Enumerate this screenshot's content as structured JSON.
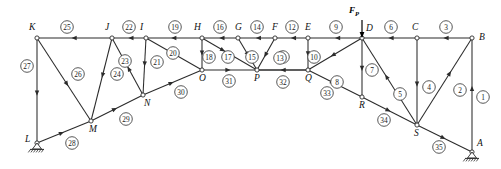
{
  "diagram": {
    "force_label": "F_P",
    "force_label_display": "F",
    "force_sub": "P",
    "force": {
      "x": 362,
      "y_label": 13,
      "y_tail": 20,
      "y_head": 37
    },
    "stroke_color": "#2b2b2b",
    "background": "#ffffff"
  },
  "nodes": [
    {
      "id": "K",
      "label": "K",
      "x": 37,
      "y": 38,
      "lx": 29,
      "ly": 30
    },
    {
      "id": "J",
      "label": "J",
      "x": 112,
      "y": 38,
      "lx": 105,
      "ly": 30
    },
    {
      "id": "I",
      "label": "I",
      "x": 146,
      "y": 38,
      "lx": 140,
      "ly": 30
    },
    {
      "id": "H",
      "label": "H",
      "x": 202,
      "y": 38,
      "lx": 194,
      "ly": 30
    },
    {
      "id": "G",
      "label": "G",
      "x": 238,
      "y": 38,
      "lx": 235,
      "ly": 30
    },
    {
      "id": "F",
      "label": "F",
      "x": 275,
      "y": 38,
      "lx": 272,
      "ly": 30
    },
    {
      "id": "E",
      "label": "E",
      "x": 308,
      "y": 38,
      "lx": 305,
      "ly": 30
    },
    {
      "id": "D",
      "label": "D",
      "x": 362,
      "y": 38,
      "lx": 366,
      "ly": 31
    },
    {
      "id": "C",
      "label": "C",
      "x": 417,
      "y": 38,
      "lx": 412,
      "ly": 30
    },
    {
      "id": "B",
      "label": "B",
      "x": 472,
      "y": 38,
      "lx": 479,
      "ly": 40
    },
    {
      "id": "L",
      "label": "L",
      "x": 37,
      "y": 143,
      "lx": 25,
      "ly": 142
    },
    {
      "id": "M",
      "label": "M",
      "x": 91,
      "y": 121,
      "lx": 89,
      "ly": 132
    },
    {
      "id": "N",
      "label": "N",
      "x": 143,
      "y": 95,
      "lx": 144,
      "ly": 106
    },
    {
      "id": "O",
      "label": "O",
      "x": 202,
      "y": 70,
      "lx": 199,
      "ly": 81
    },
    {
      "id": "P",
      "label": "P",
      "x": 257,
      "y": 70,
      "lx": 254,
      "ly": 81
    },
    {
      "id": "Q",
      "label": "Q",
      "x": 308,
      "y": 70,
      "lx": 305,
      "ly": 81
    },
    {
      "id": "R",
      "label": "R",
      "x": 362,
      "y": 97,
      "lx": 359,
      "ly": 108
    },
    {
      "id": "S",
      "label": "S",
      "x": 417,
      "y": 125,
      "lx": 414,
      "ly": 136
    },
    {
      "id": "A",
      "label": "A",
      "x": 472,
      "y": 152,
      "lx": 477,
      "ly": 146
    }
  ],
  "supports": [
    {
      "at": "L",
      "type": "pin-hatched",
      "x": 37,
      "y": 143
    },
    {
      "at": "A",
      "type": "pin-hatched",
      "x": 472,
      "y": 152
    }
  ],
  "members": [
    {
      "n": "1",
      "from": "B",
      "to": "A",
      "arrow_at": 0.58,
      "dir": "to-from",
      "cx": 483,
      "cy": 97
    },
    {
      "n": "2",
      "from": "S",
      "to": "B",
      "arrow_at": 0.62,
      "dir": "from-to",
      "cx": 460,
      "cy": 90
    },
    {
      "n": "3",
      "from": "B",
      "to": "C",
      "arrow_at": 0.52,
      "dir": "from-to",
      "cx": 446,
      "cy": 27
    },
    {
      "n": "4",
      "from": "C",
      "to": "S",
      "arrow_at": 0.56,
      "dir": "from-to",
      "cx": 429,
      "cy": 87
    },
    {
      "n": "5",
      "from": "D",
      "to": "S",
      "arrow_at": 0.58,
      "dir": "to-from",
      "cx": 400,
      "cy": 94
    },
    {
      "n": "6",
      "from": "C",
      "to": "D",
      "arrow_at": 0.52,
      "dir": "from-to",
      "cx": 391,
      "cy": 27
    },
    {
      "n": "7",
      "from": "D",
      "to": "R",
      "arrow_at": 0.56,
      "dir": "from-to",
      "cx": 372,
      "cy": 70
    },
    {
      "n": "8",
      "from": "D",
      "to": "Q",
      "arrow_at": 0.58,
      "dir": "from-to",
      "cx": 337,
      "cy": 82
    },
    {
      "n": "9",
      "from": "E",
      "to": "D",
      "arrow_at": 0.5,
      "dir": "to-from",
      "cx": 336,
      "cy": 27
    },
    {
      "n": "10",
      "from": "E",
      "to": "Q",
      "arrow_at": 0.58,
      "dir": "from-to",
      "cx": 314,
      "cy": 57
    },
    {
      "n": "11",
      "from": "P",
      "to": "Q",
      "arrow_at": 0.54,
      "dir": "to-from",
      "cx": 283,
      "cy": 57
    },
    {
      "n": "12",
      "from": "F",
      "to": "E",
      "arrow_at": 0.52,
      "dir": "to-from",
      "cx": 292,
      "cy": 27
    },
    {
      "n": "13",
      "from": "F",
      "to": "P",
      "arrow_at": 0.6,
      "dir": "from-to",
      "cx": 280,
      "cy": 58
    },
    {
      "n": "14",
      "from": "G",
      "to": "F",
      "arrow_at": 0.52,
      "dir": "to-from",
      "cx": 257,
      "cy": 27
    },
    {
      "n": "15",
      "from": "G",
      "to": "P",
      "arrow_at": 0.58,
      "dir": "from-to",
      "cx": 252,
      "cy": 57
    },
    {
      "n": "16",
      "from": "H",
      "to": "G",
      "arrow_at": 0.52,
      "dir": "to-from",
      "cx": 220,
      "cy": 27
    },
    {
      "n": "17",
      "from": "H",
      "to": "P",
      "arrow_at": 0.42,
      "dir": "from-to",
      "cx": 228,
      "cy": 57
    },
    {
      "n": "18",
      "from": "H",
      "to": "O",
      "arrow_at": 0.55,
      "dir": "from-to",
      "cx": 209,
      "cy": 57
    },
    {
      "n": "19",
      "from": "I",
      "to": "H",
      "arrow_at": 0.55,
      "dir": "to-from",
      "cx": 175,
      "cy": 27
    },
    {
      "n": "20",
      "from": "I",
      "to": "O",
      "arrow_at": 0.52,
      "dir": "from-to",
      "cx": 173,
      "cy": 53
    },
    {
      "n": "21",
      "from": "I",
      "to": "N",
      "arrow_at": 0.5,
      "dir": "from-to",
      "cx": 157,
      "cy": 62
    },
    {
      "n": "22",
      "from": "J",
      "to": "I",
      "arrow_at": 0.52,
      "dir": "to-from",
      "cx": 129,
      "cy": 27
    },
    {
      "n": "23",
      "from": "J",
      "to": "N",
      "arrow_at": 0.5,
      "dir": "to-from",
      "cx": 125,
      "cy": 61
    },
    {
      "n": "24",
      "from": "J",
      "to": "M",
      "arrow_at": 0.48,
      "dir": "from-to",
      "cx": 117,
      "cy": 74
    },
    {
      "n": "25",
      "from": "K",
      "to": "J",
      "arrow_at": 0.54,
      "dir": "to-from",
      "cx": 67,
      "cy": 27
    },
    {
      "n": "26",
      "from": "K",
      "to": "M",
      "arrow_at": 0.58,
      "dir": "from-to",
      "cx": 78,
      "cy": 74
    },
    {
      "n": "27",
      "from": "K",
      "to": "L",
      "arrow_at": 0.55,
      "dir": "from-to",
      "cx": 27,
      "cy": 66
    },
    {
      "n": "28",
      "from": "L",
      "to": "M",
      "arrow_at": 0.5,
      "dir": "from-to",
      "cx": 72,
      "cy": 143
    },
    {
      "n": "29",
      "from": "M",
      "to": "N",
      "arrow_at": 0.5,
      "dir": "from-to",
      "cx": 126,
      "cy": 119
    },
    {
      "n": "30",
      "from": "N",
      "to": "O",
      "arrow_at": 0.52,
      "dir": "from-to",
      "cx": 181,
      "cy": 92
    },
    {
      "n": "31",
      "from": "O",
      "to": "P",
      "arrow_at": 0.52,
      "dir": "from-to",
      "cx": 229,
      "cy": 81
    },
    {
      "n": "32",
      "from": "P",
      "to": "Q",
      "arrow_at": 0.0,
      "dir": "none",
      "cx": 283,
      "cy": 82
    },
    {
      "n": "33",
      "from": "Q",
      "to": "R",
      "arrow_at": 0.5,
      "dir": "from-to",
      "cx": 327,
      "cy": 93
    },
    {
      "n": "34",
      "from": "R",
      "to": "S",
      "arrow_at": 0.52,
      "dir": "from-to",
      "cx": 384,
      "cy": 120
    },
    {
      "n": "35",
      "from": "S",
      "to": "A",
      "arrow_at": 0.52,
      "dir": "from-to",
      "cx": 439,
      "cy": 147
    }
  ]
}
